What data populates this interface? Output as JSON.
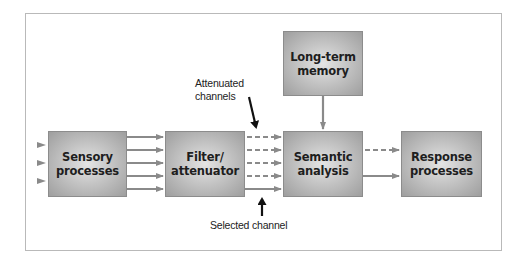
{
  "diagram": {
    "type": "flowchart",
    "title": "",
    "colors": {
      "frame_border": "#b9b9b9",
      "box_fill_center": "#e4e4e4",
      "box_fill_edge": "#9e9e9e",
      "box_text": "#1e1e1e",
      "arrow_gray": "#8a8a8a",
      "pointer_black": "#111111"
    },
    "nodes": [
      {
        "id": "sensory",
        "line1": "Sensory",
        "line2": "processes"
      },
      {
        "id": "filter",
        "line1": "Filter/",
        "line2": "attenuator"
      },
      {
        "id": "semantic",
        "line1": "Semantic",
        "line2": "analysis"
      },
      {
        "id": "memory",
        "line1": "Long-term",
        "line2": "memory"
      },
      {
        "id": "response",
        "line1": "Response",
        "line2": "processes"
      }
    ],
    "annotations": {
      "attenuated_line1": "Attenuated",
      "attenuated_line2": "channels",
      "selected": "Selected channel"
    },
    "edges": [
      {
        "from": "input",
        "to": "sensory",
        "count": 3,
        "style": "solid"
      },
      {
        "from": "sensory",
        "to": "filter",
        "count": 5,
        "style": "solid"
      },
      {
        "from": "filter",
        "to": "semantic",
        "count": 4,
        "style": "dashed",
        "label": "Attenuated channels"
      },
      {
        "from": "filter",
        "to": "semantic",
        "count": 1,
        "style": "solid",
        "label": "Selected channel"
      },
      {
        "from": "memory",
        "to": "semantic",
        "count": 1,
        "style": "solid"
      },
      {
        "from": "semantic",
        "to": "response",
        "count": 1,
        "style": "dashed"
      },
      {
        "from": "semantic",
        "to": "response",
        "count": 1,
        "style": "solid"
      }
    ]
  }
}
